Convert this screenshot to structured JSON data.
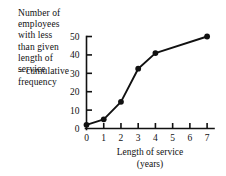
{
  "figure": {
    "side_note_primary": "Number of employees\nwith less\nthan given\nlength of\nservice",
    "side_note_secondary": "= cumulative\nfrequency"
  },
  "chart_data": {
    "type": "line",
    "title": "",
    "xlabel": "Length of service\n(years)",
    "ylabel": "Number of employees with less than given length of service = cumulative frequency",
    "x": [
      0,
      1,
      2,
      3,
      4,
      7
    ],
    "values": [
      2,
      5,
      14.5,
      32.5,
      41,
      50
    ],
    "xlim": [
      0,
      7.4
    ],
    "ylim": [
      0,
      53
    ],
    "xticks": [
      "0",
      "1",
      "2",
      "3",
      "4",
      "5",
      "6",
      "7"
    ],
    "xtick_values": [
      0,
      1,
      2,
      3,
      4,
      5,
      6,
      7
    ],
    "yticks": [
      "0",
      "10",
      "20",
      "30",
      "40",
      "50"
    ],
    "ytick_values": [
      0,
      10,
      20,
      30,
      40,
      50
    ],
    "grid": false,
    "legend": "none",
    "marker": "filled-circle",
    "line_color": "#111111",
    "marker_color": "#111111"
  }
}
